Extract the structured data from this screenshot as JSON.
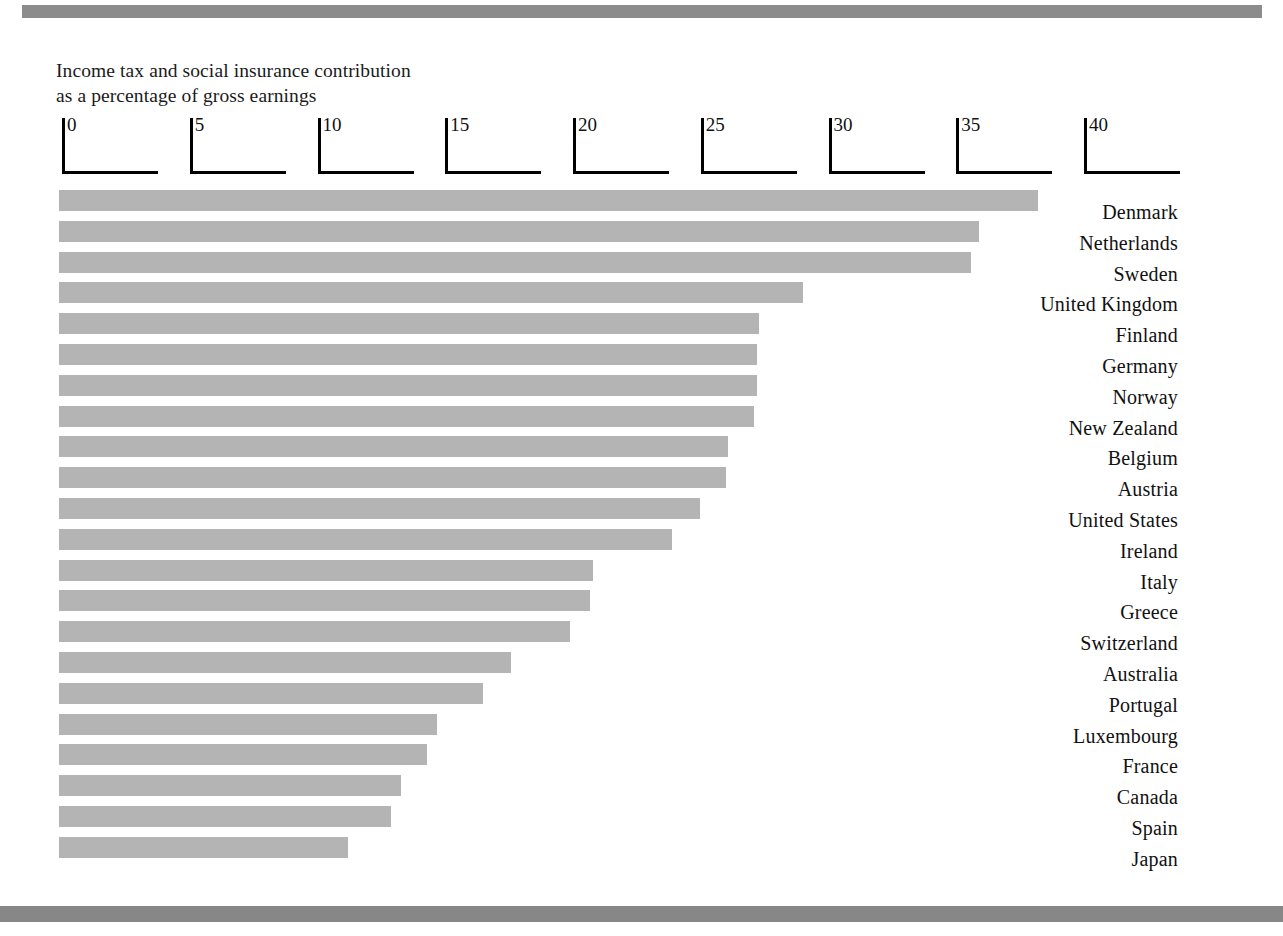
{
  "figure": {
    "title_line1": "Income tax and social insurance contribution",
    "title_line2": "as a percentage of gross earnings",
    "bar_color": "#b4b4b4",
    "axis_color": "#000000",
    "rule_color": "#8c8c8c"
  },
  "chart_data": {
    "type": "bar",
    "orientation": "horizontal",
    "xlabel": "",
    "ylabel": "",
    "xlim": [
      0,
      40
    ],
    "grid": false,
    "legend": false,
    "tick_labels": [
      "0",
      "5",
      "10",
      "15",
      "20",
      "25",
      "30",
      "35",
      "40"
    ],
    "ticks": [
      0,
      5,
      10,
      15,
      20,
      25,
      30,
      35,
      40
    ],
    "categories": [
      "Denmark",
      "Netherlands",
      "Sweden",
      "United Kingdom",
      "Finland",
      "Germany",
      "Norway",
      "New Zealand",
      "Belgium",
      "Austria",
      "United States",
      "Ireland",
      "Italy",
      "Greece",
      "Switzerland",
      "Australia",
      "Portugal",
      "Luxembourg",
      "France",
      "Canada",
      "Spain",
      "Japan"
    ],
    "values": [
      38.3,
      36.0,
      35.7,
      29.1,
      27.4,
      27.3,
      27.3,
      27.2,
      26.2,
      26.1,
      25.1,
      24.0,
      20.9,
      20.8,
      20.0,
      17.7,
      16.6,
      14.8,
      14.4,
      13.4,
      13.0,
      11.3
    ]
  }
}
